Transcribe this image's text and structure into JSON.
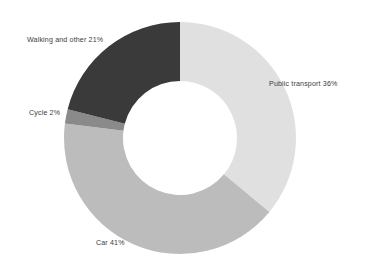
{
  "chart_data": {
    "type": "pie",
    "variant": "donut",
    "title": "",
    "subtitle": "",
    "xlabel": "",
    "ylabel": "",
    "grid": false,
    "legend": "none",
    "labels_position": "outside-direct",
    "background_color": "#ffffff",
    "label_text_color": "#3c3c3c",
    "center": {
      "x": 180,
      "y": 138
    },
    "outer_radius": 116,
    "inner_radius": 57,
    "start_angle_deg": 0,
    "direction": "clockwise",
    "units": "percent",
    "total": 100,
    "categories": [
      "Public transport",
      "Car",
      "Cycle",
      "Walking and other"
    ],
    "values": [
      36,
      41,
      2,
      21
    ],
    "colors": [
      "#e0e0e0",
      "#bcbcbc",
      "#8a8a8a",
      "#3a3a3a"
    ],
    "slices": [
      {
        "name": "Public transport",
        "value": 36,
        "value_text": "36%",
        "label": "Public transport 36%",
        "color": "#e0e0e0",
        "start_angle_deg": 0,
        "end_angle_deg": 129.6
      },
      {
        "name": "Car",
        "value": 41,
        "value_text": "41%",
        "label": "Car 41%",
        "color": "#bcbcbc",
        "start_angle_deg": 129.6,
        "end_angle_deg": 277.2
      },
      {
        "name": "Cycle",
        "value": 2,
        "value_text": "2%",
        "label": "Cycle 2%",
        "color": "#8a8a8a",
        "start_angle_deg": 277.2,
        "end_angle_deg": 284.4
      },
      {
        "name": "Walking and other",
        "value": 21,
        "value_text": "21%",
        "label": "Walking and other 21%",
        "color": "#3a3a3a",
        "start_angle_deg": 284.4,
        "end_angle_deg": 360
      }
    ]
  }
}
